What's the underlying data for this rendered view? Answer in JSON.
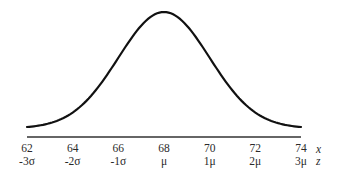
{
  "chart_data": {
    "type": "line",
    "title": "",
    "subtitle": "Normal distribution (bell curve)",
    "xlabel": "x",
    "secondary_xlabel": "z",
    "ylabel": "",
    "grid": false,
    "legend": null,
    "mean": 68,
    "std_dev": 2,
    "xlim": [
      62,
      74
    ],
    "x_ticks": [
      62,
      64,
      66,
      68,
      70,
      72,
      74
    ],
    "x_tick_labels": [
      "62",
      "64",
      "66",
      "68",
      "70",
      "72",
      "74"
    ],
    "z_tick_labels": [
      "-3σ",
      "-2σ",
      "-1σ",
      "μ",
      "1μ",
      "2μ",
      "3μ"
    ],
    "series": [
      {
        "name": "normal-curve",
        "x": [
          62,
          63,
          64,
          65,
          66,
          67,
          68,
          69,
          70,
          71,
          72,
          73,
          74
        ],
        "values": [
          0.0022,
          0.0088,
          0.027,
          0.0648,
          0.121,
          0.176,
          0.1995,
          0.176,
          0.121,
          0.0648,
          0.027,
          0.0088,
          0.0022
        ]
      }
    ],
    "colors": {
      "curve": "#111111",
      "axis": "#333333",
      "text": "#2a2a2a"
    }
  },
  "labels": {
    "x_axis_var": "x",
    "z_axis_var": "z"
  }
}
